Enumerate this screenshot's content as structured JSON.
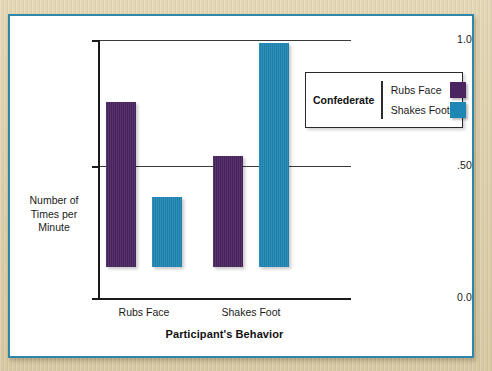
{
  "chart_data": {
    "type": "bar",
    "title": "",
    "subtitle": "",
    "xlabel": "Participant's Behavior",
    "ylabel": "Number of Times per Minute",
    "categories": [
      "Rubs Face",
      "Shakes Foot"
    ],
    "series": [
      {
        "name": "Rubs Face",
        "values": [
          0.64,
          0.43
        ],
        "color": "#4a2560"
      },
      {
        "name": "Shakes Foot",
        "values": [
          0.27,
          0.87
        ],
        "color": "#1f87b4"
      }
    ],
    "ylim": [
      0.0,
      1.0
    ],
    "ytick_values": [
      0.0,
      0.5,
      1.0
    ],
    "ytick_labels": [
      "0.0",
      ".50",
      "1.0"
    ],
    "grid": true,
    "gridlines_at": [
      0.5,
      1.0
    ],
    "legend": {
      "title": "Confederate",
      "position": "inside-top-right",
      "entries": [
        {
          "label": "Rubs Face",
          "color": "#4a2560",
          "swatch": "purple-swatch"
        },
        {
          "label": "Shakes Foot",
          "color": "#1f87b4",
          "swatch": "blue-swatch"
        }
      ]
    }
  },
  "axes": {
    "y_title_lines": [
      "Number of",
      "Times per",
      "Minute"
    ],
    "y_title_text": "Number of Times per Minute",
    "x_title": "Participant's Behavior",
    "ytick_labels": {
      "top": "1.0",
      "mid": ".50",
      "bottom": "0.0"
    },
    "xtick_labels": {
      "group0": "Rubs Face",
      "group1": "Shakes Foot"
    }
  },
  "legend": {
    "title": "Confederate",
    "entry0_label": "Rubs Face",
    "entry1_label": "Shakes Foot"
  },
  "theme": {
    "purple": "#4a2560",
    "blue": "#1f87b4",
    "border_teal": "#2e86ab",
    "page_tan": "#ddd0ac",
    "card_white": "#ffffff",
    "axis_black": "#1a1a1a"
  }
}
